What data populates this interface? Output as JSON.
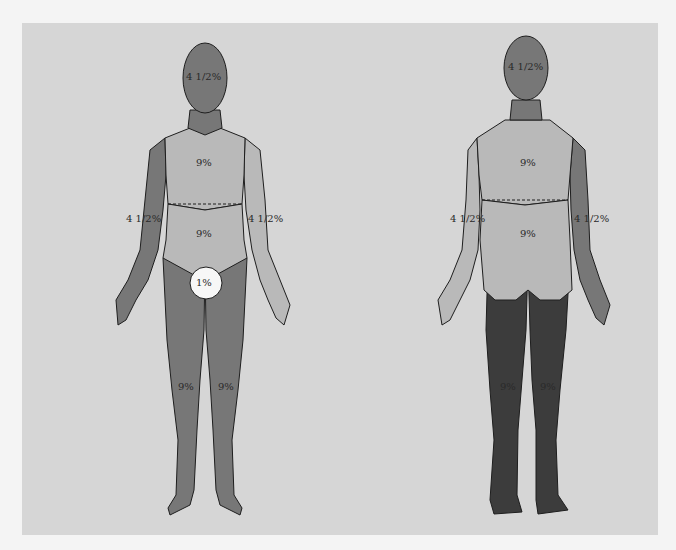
{
  "diagram": {
    "type": "rule-of-nines-body-surface-area",
    "colors": {
      "background": "#d6d6d6",
      "light_region": "#b9b9b9",
      "medium_region": "#777777",
      "dark_region": "#3c3c3c",
      "perineum_circle": "#f7f7f7",
      "outline": "#1e1e1e"
    },
    "front_view": {
      "head": "4 1/2%",
      "anterior_trunk_upper": "9%",
      "anterior_trunk_lower": "9%",
      "right_arm": "4 1/2%",
      "left_arm": "4 1/2%",
      "genitalia": "1%",
      "right_leg": "9%",
      "left_leg": "9%"
    },
    "back_view": {
      "head": "4 1/2%",
      "posterior_trunk_upper": "9%",
      "posterior_trunk_lower": "9%",
      "left_arm": "4 1/2%",
      "right_arm": "4 1/2%",
      "left_leg": "9%",
      "right_leg": "9%"
    }
  }
}
